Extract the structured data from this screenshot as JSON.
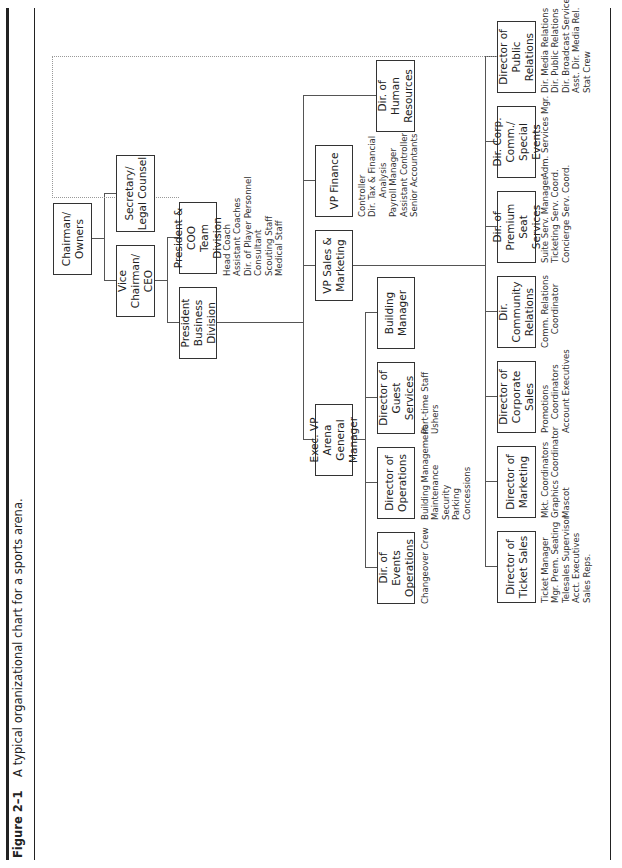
{
  "caption": {
    "figure_label": "Figure 2–1",
    "text": "A typical organizational chart for a sports arena."
  },
  "org": {
    "chairman": "Chairman/\nOwners",
    "vice_chairman": "Vice Chairman/\nCEO",
    "secretary": "Secretary/\nLegal Counsel",
    "president_business": "President\nBusiness Division",
    "president_coo": "President & COO\nTeam Division",
    "president_coo_staff": "Head Coach\nAssistant Coaches\nDir. of Player Personnel\nConsultant\nScouting Staff\nMedical Staff",
    "vp_sales": "VP Sales &\nMarketing",
    "vp_finance": "VP Finance",
    "vp_finance_staff": "Controller\nDir. Tax & Financial\n       Analysis\nPayroll Manager\nAssistant Controller\nSenior Accountants",
    "hr": "Dir. of Human\nResources",
    "exec_vp": "Exec. VP Arena\nGeneral Manager",
    "building_manager": "Building\nManager",
    "guest_services": "Director of\nGuest Services",
    "guest_services_staff": "Part-time Staff\nUshers",
    "operations": "Director of\nOperations",
    "operations_staff": "Building Management\nMaintenance\nSecurity\nParking\nConcessions",
    "events_ops": "Dir. of Events\nOperations",
    "events_ops_staff": "Changeover Crew",
    "ticket_sales": "Director of\nTicket Sales",
    "ticket_sales_staff": "Ticket Manager\nMgr. Prem. Seating\nTelesales Supervisor\nAcct. Executives\nSales Reps.",
    "marketing": "Director of\nMarketing",
    "marketing_staff": "Mkt. Coordinators\nGraphics Coordinator\nMascot",
    "corporate_sales": "Director of\nCorporate Sales",
    "corporate_sales_staff": "Promotions\n     Coordinators\nAccount Executives",
    "community": "Dir. Community\nRelations",
    "community_staff": "Comm. Relations\n     Coordinator",
    "premium": "Dir. of Premium\nSeat Services",
    "premium_staff": "Suite Serv. Manager\nTicketing Serv. Coord.\nConcierge Serv. Coord.",
    "corp_comm": "Dir. Corp. Comm./\nSpecial Events",
    "corp_comm_staff": "Adm. Services Mgr.",
    "public_relations": "Director of\nPublic Relations",
    "public_relations_staff": "Dir. Media Relations\nDir. Public Relations\nDir. Broadcast Services\nAsst. Dir. Media Rel.\nStat Crew"
  }
}
